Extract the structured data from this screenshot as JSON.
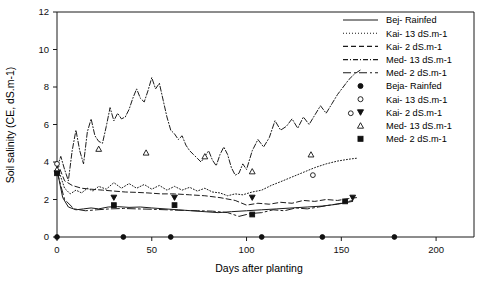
{
  "chart_data": {
    "type": "line",
    "title": "",
    "xlabel": "Days after planting",
    "ylabel": "Soil salinity (CE, dS.m-1)",
    "xlim": [
      0,
      220
    ],
    "ylim": [
      0,
      12
    ],
    "xticks": [
      0,
      50,
      100,
      150,
      200
    ],
    "yticks": [
      0,
      2,
      4,
      6,
      8,
      10,
      12
    ],
    "grid": false,
    "legend_position": "top-right",
    "frame": "top-right-box",
    "series": [
      {
        "name": "Bej- Rainfed",
        "style": "solid",
        "x": [
          0,
          3,
          6,
          10,
          14,
          18,
          22,
          27,
          32,
          38,
          44,
          50,
          57,
          64,
          71,
          78,
          85,
          92,
          100,
          108,
          116,
          124,
          132,
          140,
          148,
          156
        ],
        "y": [
          3.6,
          2.1,
          1.6,
          1.45,
          1.5,
          1.55,
          1.5,
          1.6,
          1.62,
          1.58,
          1.6,
          1.55,
          1.5,
          1.45,
          1.4,
          1.35,
          1.3,
          1.35,
          1.4,
          1.45,
          1.5,
          1.55,
          1.6,
          1.65,
          1.75,
          1.9
        ]
      },
      {
        "name": "Kai- 13 dS.m-1",
        "style": "dotted",
        "x": [
          0,
          2,
          4,
          7,
          10,
          13,
          16,
          19,
          22,
          26,
          30,
          34,
          38,
          42,
          46,
          50,
          54,
          58,
          62,
          66,
          70,
          74,
          78,
          82,
          86,
          90,
          94,
          98,
          103,
          108,
          113,
          118,
          124,
          130,
          136,
          142,
          148,
          154,
          158
        ],
        "y": [
          3.9,
          3.2,
          2.6,
          2.3,
          2.5,
          2.35,
          2.6,
          2.45,
          2.7,
          2.55,
          2.9,
          2.6,
          2.85,
          2.6,
          2.8,
          2.55,
          2.75,
          2.5,
          2.7,
          2.5,
          2.65,
          2.45,
          2.6,
          2.4,
          2.35,
          2.2,
          2.3,
          2.25,
          2.4,
          2.5,
          2.75,
          2.95,
          3.2,
          3.45,
          3.7,
          3.9,
          4.05,
          4.15,
          4.2
        ]
      },
      {
        "name": "Kai- 2 dS.m-1",
        "style": "dashed",
        "x": [
          0,
          4,
          8,
          13,
          18,
          24,
          30,
          36,
          42,
          48,
          55,
          62,
          70,
          78,
          86,
          94,
          100,
          106,
          112,
          118,
          124,
          130,
          136,
          142,
          148,
          154,
          158
        ],
        "y": [
          4.0,
          3.0,
          2.75,
          2.6,
          2.55,
          2.5,
          2.45,
          2.4,
          2.38,
          2.35,
          2.3,
          2.3,
          2.25,
          2.2,
          2.1,
          1.95,
          1.7,
          1.8,
          1.75,
          1.85,
          1.8,
          1.95,
          1.9,
          2.0,
          1.95,
          2.05,
          2.1
        ]
      },
      {
        "name": "Med- 13 dS.m-1",
        "style": "dashdot",
        "x": [
          0,
          2,
          4,
          6,
          8,
          10,
          12,
          14,
          16,
          18,
          20,
          22,
          24,
          26,
          28,
          30,
          32,
          34,
          36,
          38,
          40,
          42,
          44,
          46,
          48,
          50,
          52,
          54,
          56,
          58,
          60,
          62,
          64,
          66,
          68,
          70,
          72,
          74,
          76,
          78,
          80,
          82,
          84,
          86,
          88,
          90,
          92,
          94,
          96,
          98,
          100,
          103,
          106,
          109,
          112,
          115,
          118,
          121,
          124,
          127,
          130,
          133,
          136,
          139,
          142,
          145,
          148,
          151,
          154,
          157,
          160
        ],
        "y": [
          3.7,
          4.3,
          3.6,
          3.0,
          4.6,
          5.7,
          4.6,
          3.9,
          5.6,
          6.3,
          5.4,
          5.1,
          5.0,
          5.9,
          6.9,
          6.2,
          6.6,
          6.3,
          6.4,
          6.8,
          7.4,
          7.9,
          7.4,
          7.2,
          7.8,
          8.5,
          7.9,
          8.2,
          7.3,
          6.4,
          5.7,
          5.5,
          5.2,
          5.4,
          4.9,
          4.6,
          4.4,
          4.2,
          4.0,
          4.3,
          4.6,
          4.1,
          3.8,
          4.4,
          4.8,
          4.4,
          3.7,
          3.3,
          3.4,
          3.9,
          3.6,
          4.6,
          5.2,
          4.8,
          5.3,
          6.2,
          5.7,
          5.9,
          6.3,
          5.8,
          6.4,
          6.0,
          6.5,
          7.0,
          6.6,
          7.1,
          7.6,
          8.0,
          8.4,
          8.7,
          8.9
        ]
      },
      {
        "name": "Med- 2 dS.m-1",
        "style": "longdash",
        "x": [
          0,
          4,
          9,
          15,
          21,
          28,
          35,
          42,
          50,
          58,
          66,
          74,
          82,
          90,
          96,
          102,
          108,
          114,
          120,
          126,
          132,
          138,
          144,
          150,
          156
        ],
        "y": [
          3.5,
          2.0,
          1.5,
          1.4,
          1.45,
          1.5,
          1.52,
          1.5,
          1.48,
          1.45,
          1.42,
          1.4,
          1.38,
          1.3,
          1.1,
          1.25,
          1.3,
          1.45,
          1.4,
          1.55,
          1.5,
          1.6,
          1.7,
          1.8,
          1.95
        ]
      }
    ],
    "marker_series": [
      {
        "name": "Beja- Rainfed",
        "marker": "filled-circle",
        "x": [
          0,
          35,
          60,
          108,
          140,
          178
        ],
        "y": [
          0,
          0,
          0,
          0,
          0,
          0
        ]
      },
      {
        "name": "Kai- 13 dS.m-1",
        "marker": "open-circle",
        "x": [
          0,
          135,
          155
        ],
        "y": [
          3.9,
          3.3,
          6.6
        ]
      },
      {
        "name": "Kai- 2 dS.m-1",
        "marker": "filled-triangle-down",
        "x": [
          0,
          30,
          62,
          103,
          156
        ],
        "y": [
          3.4,
          2.1,
          2.1,
          2.1,
          2.1
        ]
      },
      {
        "name": "Med- 13 dS.m-1",
        "marker": "open-triangle-up",
        "x": [
          0,
          22,
          47,
          78,
          103,
          134
        ],
        "y": [
          3.6,
          4.7,
          4.5,
          4.3,
          3.5,
          4.4
        ]
      },
      {
        "name": "Med- 2 dS.m-1",
        "marker": "filled-square",
        "x": [
          0,
          30,
          62,
          103,
          152
        ],
        "y": [
          3.4,
          1.7,
          1.7,
          1.2,
          1.9
        ]
      }
    ]
  },
  "legend": {
    "line_entries": [
      {
        "label": "Bej- Rainfed",
        "style": "solid"
      },
      {
        "label": "Kai- 13 dS.m-1",
        "style": "dotted"
      },
      {
        "label": "Kai- 2 dS.m-1",
        "style": "dashed"
      },
      {
        "label": "Med- 13 dS.m-1",
        "style": "dashdot"
      },
      {
        "label": "Med- 2 dS.m-1",
        "style": "longdash"
      }
    ],
    "marker_entries": [
      {
        "label": "Beja- Rainfed",
        "marker": "filled-circle"
      },
      {
        "label": "Kai- 13 dS.m-1",
        "marker": "open-circle"
      },
      {
        "label": "Kai- 2 dS.m-1",
        "marker": "filled-triangle-down"
      },
      {
        "label": "Med- 13 dS.m-1",
        "marker": "open-triangle-up"
      },
      {
        "label": "Med- 2 dS.m-1",
        "marker": "filled-square"
      }
    ]
  },
  "colors": {
    "ink": "#1a1a1a",
    "background": "#ffffff"
  }
}
